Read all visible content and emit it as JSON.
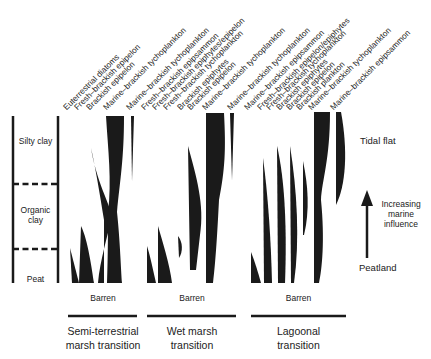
{
  "lithology": {
    "units": [
      "Silty clay",
      "Organic clay",
      "Peat"
    ]
  },
  "panels": [
    {
      "title_line1": "Semi-terrestrial",
      "title_line2": "marsh transition",
      "base_label": "Barren",
      "taxa": [
        "Euterrestrial diatoms",
        "Fresh–brackish epipelon",
        "Brackish epipelon",
        "Marine–brackish tychoplankton"
      ]
    },
    {
      "title_line1": "Wet marsh",
      "title_line2": "transition",
      "base_label": "Barren",
      "taxa": [
        "Marine–brackish tychoplankton",
        "Fresh–brackish epipsammon",
        "Fresh–brackish epiphytes/epipelon",
        "Fresh–brackish tychoplankton",
        "Brackish epiphytes",
        "Brackish epipelon",
        "Marine–brackish tychoplankton"
      ]
    },
    {
      "title_line1": "Lagoonal",
      "title_line2": "transition",
      "base_label": "Barren",
      "taxa": [
        "Marine–brackish tychoplankton",
        "Marine–brackish epipsammon",
        "Fresh–brackish epipelon/epiphytes",
        "Fresh–brackish tychoplankton",
        "Brackish epiphytes",
        "Brackish epipelon",
        "Brackish plankton",
        "Marine–brackish tychoplankton",
        "Marine–brackish epipsammon"
      ]
    }
  ],
  "gradient": {
    "top_label": "Tidal flat",
    "bottom_label": "Peatland",
    "arrow_label_line1": "Increasing",
    "arrow_label_line2": "marine",
    "arrow_label_line3": "influence",
    "arrow_icon": "up-arrow-icon"
  },
  "colors": {
    "ink": "#1a1a1a",
    "background": "#ffffff"
  }
}
